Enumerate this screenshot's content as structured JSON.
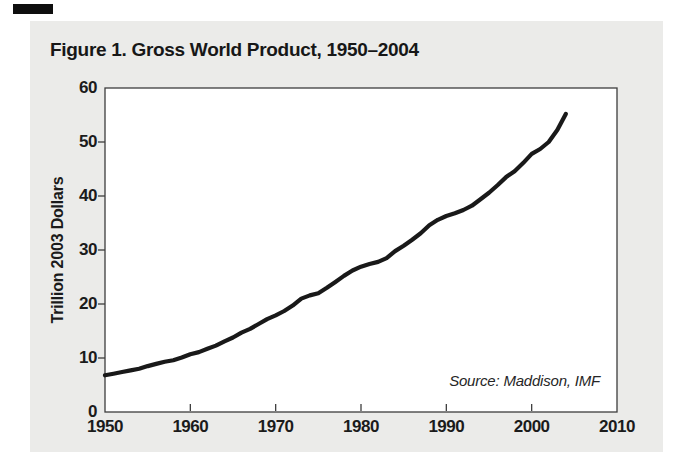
{
  "page": {
    "title": "Figure 1. Gross World Product, 1950–2004",
    "page_background_color": "#ebebe9",
    "scan_mark_color": "#0e0e0e"
  },
  "chart_data": {
    "type": "line",
    "title": "Figure 1. Gross World Product, 1950–2004",
    "xlabel": "",
    "ylabel": "Trillion 2003 Dollars",
    "source_note": "Source: Maddison, IMF",
    "xlim": [
      1950,
      2010
    ],
    "ylim": [
      0,
      60
    ],
    "x_ticks": [
      1950,
      1960,
      1970,
      1980,
      1990,
      2000,
      2010
    ],
    "y_ticks": [
      0,
      10,
      20,
      30,
      40,
      50,
      60
    ],
    "grid": false,
    "legend_position": "none",
    "line_color": "#191919",
    "frame_color": "#3d3d3d",
    "series": [
      {
        "name": "Gross World Product",
        "x": [
          1950,
          1951,
          1952,
          1953,
          1954,
          1955,
          1956,
          1957,
          1958,
          1959,
          1960,
          1961,
          1962,
          1963,
          1964,
          1965,
          1966,
          1967,
          1968,
          1969,
          1970,
          1971,
          1972,
          1973,
          1974,
          1975,
          1976,
          1977,
          1978,
          1979,
          1980,
          1981,
          1982,
          1983,
          1984,
          1985,
          1986,
          1987,
          1988,
          1989,
          1990,
          1991,
          1992,
          1993,
          1994,
          1995,
          1996,
          1997,
          1998,
          1999,
          2000,
          2001,
          2002,
          2003,
          2004
        ],
        "values": [
          6.8,
          7.1,
          7.4,
          7.7,
          8.0,
          8.5,
          8.9,
          9.3,
          9.6,
          10.1,
          10.7,
          11.1,
          11.7,
          12.3,
          13.1,
          13.8,
          14.7,
          15.4,
          16.3,
          17.2,
          17.9,
          18.7,
          19.7,
          21.0,
          21.6,
          22.0,
          23.0,
          24.1,
          25.2,
          26.2,
          26.9,
          27.4,
          27.8,
          28.5,
          29.8,
          30.8,
          31.9,
          33.1,
          34.6,
          35.6,
          36.3,
          36.8,
          37.4,
          38.2,
          39.4,
          40.6,
          42.0,
          43.5,
          44.6,
          46.1,
          47.8,
          48.7,
          50.0,
          52.2,
          55.2
        ]
      }
    ]
  }
}
